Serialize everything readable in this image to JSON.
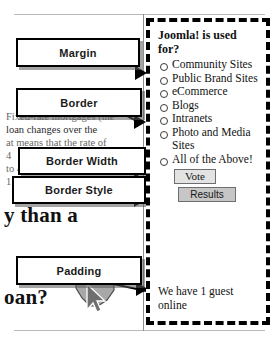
{
  "diagram": {
    "type": "css-box-model-annotation",
    "callouts": [
      {
        "id": "margin",
        "label": "Margin"
      },
      {
        "id": "border",
        "label": "Border"
      },
      {
        "id": "border-width",
        "label": "Border Width"
      },
      {
        "id": "border-style",
        "label": "Border Style"
      },
      {
        "id": "padding",
        "label": "Padding"
      }
    ]
  },
  "background_article": {
    "lines": [
      "Fixed-rate mortgages (the",
      "loan changes over the",
      "at means that the rate of",
      "4",
      "to 4.50%, for example)",
      "1"
    ],
    "headlines": [
      "y than a",
      "oan?"
    ]
  },
  "module": {
    "title": "Joomla! is used for?",
    "options": [
      "Community Sites",
      "Public Brand Sites",
      "eCommerce",
      "Blogs",
      "Intranets",
      "Photo and Media Sites",
      "All of the Above!"
    ],
    "buttons": {
      "vote": "Vote",
      "results": "Results"
    },
    "whos_online": "We have 1 guest online"
  },
  "colors": {
    "border": "#000000",
    "shadow": "#5a5a5a",
    "button_results_bg": "#c6c6c6",
    "button_vote_bg": "#e3e3e3",
    "page_rule": "#b9b9b9"
  },
  "icons": {
    "radio": "radio-button-icon",
    "cursor": "mouse-cursor-icon"
  }
}
